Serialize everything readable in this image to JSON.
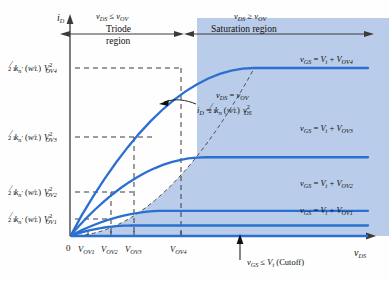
{
  "figure": {
    "background": "#fefefe",
    "curve_color": "#2b6fd0",
    "shade_color": "#b9cce9",
    "dash_color": "#51514f",
    "axis_color": "#3a3a38",
    "text_color": "#101010"
  },
  "axes": {
    "y_axis_label": "i_D",
    "x_axis_label": "v_DS",
    "origin_label": "0",
    "x_tick_labels": [
      "V_OV1",
      "V_OV2",
      "V_OV3",
      "V_OV4"
    ],
    "y_tick_labels": [
      "1/2 k'_n (W/L) V^2_OV1",
      "1/2 k'_n (W/L) V^2_OV2",
      "1/2 k'_n (W/L) V^2_OV3",
      "1/2 k'_n (W/L) V^2_OV4"
    ]
  },
  "regions": {
    "triode": {
      "condition": "v_DS <= v_OV",
      "name_line1": "Triode",
      "name_line2": "region"
    },
    "saturation": {
      "condition": "v_DS >= v_OV",
      "name": "Saturation region"
    }
  },
  "annotations": {
    "boundary_condition": "v_DS = v_OV",
    "boundary_equation": "i_D = 1/2 k_n (W/L) v^2_DS",
    "cutoff": "v_GS <= V_t (Cutoff)"
  },
  "curve_labels": [
    "v_GS = V_t + V_OV1",
    "v_GS = V_t + V_OV2",
    "v_GS = V_t + V_OV3",
    "v_GS = V_t + V_OV4"
  ],
  "chart_data": {
    "type": "line",
    "xlabel": "v_DS",
    "ylabel": "i_D",
    "xlim": [
      0,
      4.85
    ],
    "ylim": [
      0,
      9.3
    ],
    "grid": false,
    "legend": "right-of-curve-inline",
    "x_ticks": [
      1,
      1.55,
      2.2,
      3.0
    ],
    "x_tick_labels": [
      "V_OV1",
      "V_OV2",
      "V_OV3",
      "V_OV4"
    ],
    "y_ticks": [
      0.5,
      1.2,
      3.75,
      8.0
    ],
    "y_tick_labels": [
      "1/2 k'_n (W/L) V^2_OV1",
      "1/2 k'_n (W/L) V^2_OV2",
      "1/2 k'_n (W/L) V^2_OV3",
      "1/2 k'_n (W/L) V^2_OV4"
    ],
    "series": [
      {
        "name": "v_GS = V_t + V_OV1",
        "v_ov": 1.0,
        "i_sat": 0.5,
        "saturates_at_x": 1.0
      },
      {
        "name": "v_GS = V_t + V_OV2",
        "v_ov": 1.55,
        "i_sat": 1.2,
        "saturates_at_x": 1.55
      },
      {
        "name": "v_GS = V_t + V_OV3",
        "v_ov": 2.2,
        "i_sat": 3.75,
        "saturates_at_x": 2.2
      },
      {
        "name": "v_GS = V_t + V_OV4",
        "v_ov": 3.0,
        "i_sat": 8.0,
        "saturates_at_x": 3.0
      }
    ],
    "boundary_curve": {
      "name": "v_DS = v_OV boundary (locus of saturation points)",
      "equation": "i_D = 1/2 k_n (W/L) v^2_DS",
      "style": "dashed",
      "points": [
        [
          0,
          0
        ],
        [
          1.0,
          0.5
        ],
        [
          1.55,
          1.2
        ],
        [
          2.2,
          3.75
        ],
        [
          3.0,
          8.0
        ]
      ]
    },
    "cutoff_line": {
      "name": "v_GS <= V_t (Cutoff)",
      "value": 0
    }
  }
}
